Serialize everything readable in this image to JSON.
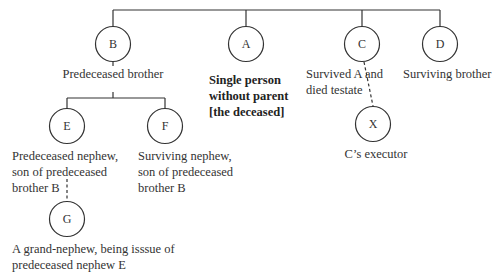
{
  "diagram": {
    "type": "family-tree",
    "nodes": [
      {
        "id": "B",
        "letter": "B",
        "caption_lines": [
          "Predeceased brother"
        ],
        "bold": false
      },
      {
        "id": "A",
        "letter": "A",
        "caption_lines": [
          "Single person",
          "without parent",
          "[the deceased]"
        ],
        "bold": true
      },
      {
        "id": "C",
        "letter": "C",
        "caption_lines": [
          "Survived A and",
          "died testate"
        ],
        "bold": false
      },
      {
        "id": "D",
        "letter": "D",
        "caption_lines": [
          "Surviving brother"
        ],
        "bold": false
      },
      {
        "id": "E",
        "letter": "E",
        "caption_lines": [
          "Predeceased nephew,",
          "son of predeceased",
          "brother B"
        ],
        "bold": false
      },
      {
        "id": "F",
        "letter": "F",
        "caption_lines": [
          "Surviving nephew,",
          "son of predeceased",
          "brother B"
        ],
        "bold": false
      },
      {
        "id": "X",
        "letter": "X",
        "caption_lines": [
          "C’s executor"
        ],
        "bold": false
      },
      {
        "id": "G",
        "letter": "G",
        "caption_lines": [
          "A grand-nephew, being isssue of",
          "predeceased nephew E"
        ],
        "bold": false
      }
    ],
    "edges": [
      {
        "from": "parents",
        "to": "B",
        "style": "solid"
      },
      {
        "from": "parents",
        "to": "A",
        "style": "solid"
      },
      {
        "from": "parents",
        "to": "C",
        "style": "solid"
      },
      {
        "from": "parents",
        "to": "D",
        "style": "solid"
      },
      {
        "from": "B",
        "to": "E",
        "style": "solid"
      },
      {
        "from": "B",
        "to": "F",
        "style": "solid"
      },
      {
        "from": "C",
        "to": "X",
        "style": "dashed"
      },
      {
        "from": "E",
        "to": "G",
        "style": "dashed"
      }
    ]
  }
}
